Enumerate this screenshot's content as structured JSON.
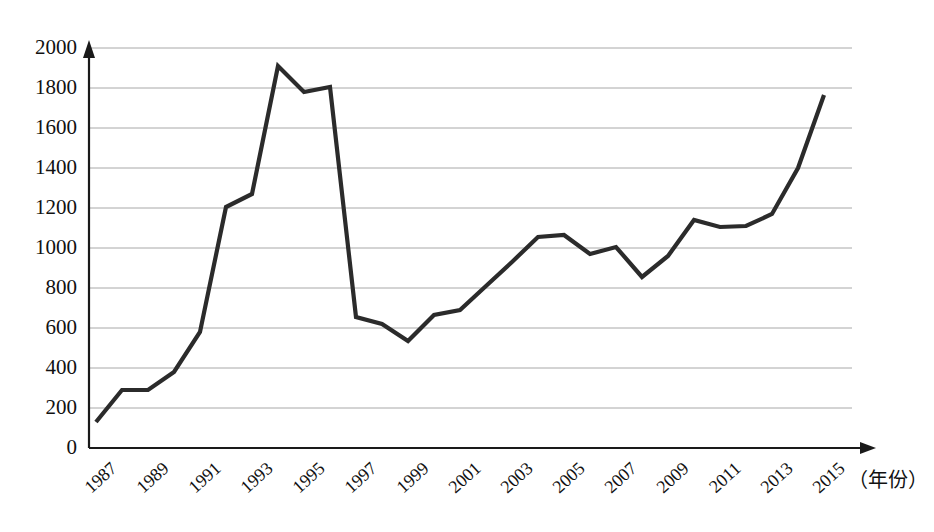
{
  "chart_data": {
    "type": "line",
    "title": "",
    "subtitle": "",
    "xlabel": "（年份）",
    "ylabel": "",
    "x": [
      1987,
      1988,
      1989,
      1990,
      1991,
      1992,
      1993,
      1994,
      1995,
      1996,
      1997,
      1998,
      1999,
      2000,
      2001,
      2002,
      2003,
      2004,
      2005,
      2006,
      2007,
      2008,
      2009,
      2010,
      2011,
      2012,
      2013,
      2014,
      2015
    ],
    "values": [
      130,
      290,
      290,
      380,
      580,
      1205,
      1270,
      1910,
      1780,
      1805,
      655,
      620,
      535,
      665,
      690,
      810,
      930,
      1055,
      1065,
      970,
      1005,
      855,
      960,
      1140,
      1105,
      1110,
      1170,
      1400,
      1765
    ],
    "series": [
      {
        "name": "",
        "values": [
          130,
          290,
          290,
          380,
          580,
          1205,
          1270,
          1910,
          1780,
          1805,
          655,
          620,
          535,
          665,
          690,
          810,
          930,
          1055,
          1065,
          970,
          1005,
          855,
          960,
          1140,
          1105,
          1110,
          1170,
          1400,
          1765
        ]
      }
    ],
    "xtick_labels": [
      "1987",
      "1989",
      "1991",
      "1993",
      "1995",
      "1997",
      "1999",
      "2001",
      "2003",
      "2005",
      "2007",
      "2009",
      "2011",
      "2013",
      "2015"
    ],
    "xtick_values": [
      1987,
      1989,
      1991,
      1993,
      1995,
      1997,
      1999,
      2001,
      2003,
      2005,
      2007,
      2009,
      2011,
      2013,
      2015
    ],
    "ytick_labels": [
      "0",
      "200",
      "400",
      "600",
      "800",
      "1000",
      "1200",
      "1400",
      "1600",
      "1800",
      "2000"
    ],
    "ytick_values": [
      0,
      200,
      400,
      600,
      800,
      1000,
      1200,
      1400,
      1600,
      1800,
      2000
    ],
    "ylim": [
      0,
      2000
    ],
    "xlim": [
      1986.5,
      2016.5
    ],
    "grid": "horizontal",
    "legend": "none",
    "line_color": "#2b2b2b",
    "grid_color": "#a8a8a8",
    "axis_color": "#1a1a1a",
    "background_color": "#ffffff"
  }
}
